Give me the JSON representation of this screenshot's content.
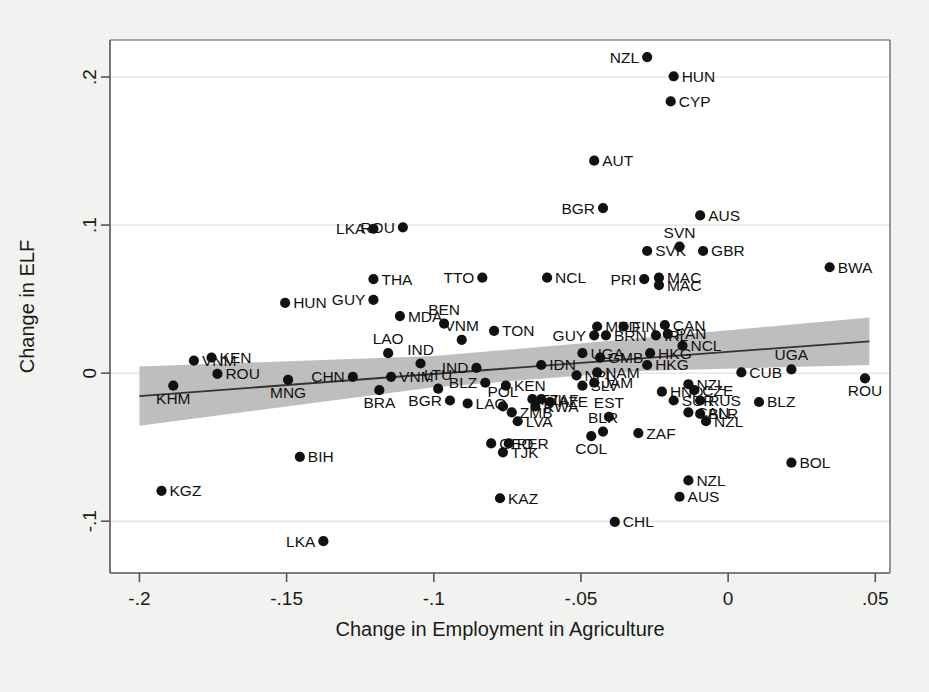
{
  "figure": {
    "background_color": "#f2f2f0",
    "plot_background_color": "#ffffff",
    "marker_color": "#111111",
    "fit_line_color": "#333333",
    "ci_band_color": "#b3b3b3"
  },
  "chart_data": {
    "type": "scatter",
    "title": "",
    "subtitle": "",
    "xlabel": "Change in Employment in Agriculture",
    "ylabel": "Change in ELF",
    "xlim": [
      -0.21,
      0.055
    ],
    "ylim": [
      -0.135,
      0.225
    ],
    "xticks": [
      -0.2,
      -0.15,
      -0.1,
      -0.05,
      0,
      0.05
    ],
    "xticklabels": [
      "-.2",
      "-.15",
      "-.1",
      "-.05",
      "0",
      ".05"
    ],
    "yticks": [
      -0.1,
      0,
      0.1,
      0.2
    ],
    "yticklabels": [
      "-.1",
      "0",
      ".1",
      ".2"
    ],
    "grid": true,
    "grid_axis": "y",
    "legend": null,
    "annotations": [],
    "fit_line": {
      "x": [
        -0.2,
        0.048
      ],
      "y": [
        -0.0155,
        0.0215
      ],
      "label": "linear fit"
    },
    "ci_band": {
      "x": [
        -0.2,
        -0.1,
        -0.03,
        0.048
      ],
      "upper": [
        0.0045,
        0.0115,
        0.0235,
        0.0375
      ],
      "lower": [
        -0.0355,
        -0.0095,
        0.0015,
        0.0055
      ],
      "label": "95% confidence interval"
    },
    "point_label_field": "iso3",
    "points": [
      {
        "iso3": "KGZ",
        "x": -0.1925,
        "y": -0.0795,
        "lp": "right"
      },
      {
        "iso3": "VNM",
        "x": -0.1815,
        "y": 0.0085,
        "lp": "right"
      },
      {
        "iso3": "KEN",
        "x": -0.1755,
        "y": 0.0105,
        "lp": "right"
      },
      {
        "iso3": "ROU",
        "x": -0.1735,
        "y": -0.0005,
        "lp": "right"
      },
      {
        "iso3": "KHM",
        "x": -0.1885,
        "y": -0.0085,
        "lp": "below"
      },
      {
        "iso3": "BIH",
        "x": -0.1455,
        "y": -0.0565,
        "lp": "right"
      },
      {
        "iso3": "LKA",
        "x": -0.1375,
        "y": -0.1135,
        "lp": "left"
      },
      {
        "iso3": "MNG",
        "x": -0.1495,
        "y": -0.0045,
        "lp": "below"
      },
      {
        "iso3": "HUN",
        "x": -0.1505,
        "y": 0.0475,
        "lp": "right"
      },
      {
        "iso3": "THA",
        "x": -0.1205,
        "y": 0.0635,
        "lp": "right"
      },
      {
        "iso3": "GUY",
        "x": -0.1205,
        "y": 0.0495,
        "lp": "left"
      },
      {
        "iso3": "MDA",
        "x": -0.1115,
        "y": 0.0385,
        "lp": "right"
      },
      {
        "iso3": "LAO",
        "x": -0.1155,
        "y": 0.0135,
        "lp": "above"
      },
      {
        "iso3": "CHN",
        "x": -0.1275,
        "y": -0.0025,
        "lp": "left"
      },
      {
        "iso3": "VNM",
        "x": -0.1145,
        "y": -0.0025,
        "lp": "right"
      },
      {
        "iso3": "BRA",
        "x": -0.1185,
        "y": -0.0115,
        "lp": "below"
      },
      {
        "iso3": "IND",
        "x": -0.1045,
        "y": 0.0065,
        "lp": "above"
      },
      {
        "iso3": "LTU",
        "x": -0.0985,
        "y": -0.0105,
        "lp": "above"
      },
      {
        "iso3": "BGR",
        "x": -0.0945,
        "y": -0.0185,
        "lp": "left"
      },
      {
        "iso3": "LAO",
        "x": -0.0885,
        "y": -0.0205,
        "lp": "right"
      },
      {
        "iso3": "ROU",
        "x": -0.1105,
        "y": 0.0985,
        "lp": "left"
      },
      {
        "iso3": "LKA",
        "x": -0.1205,
        "y": 0.0975,
        "lp": "left"
      },
      {
        "iso3": "BEN",
        "x": -0.0965,
        "y": 0.0335,
        "lp": "above"
      },
      {
        "iso3": "VNM",
        "x": -0.0905,
        "y": 0.0225,
        "lp": "above"
      },
      {
        "iso3": "IND",
        "x": -0.0855,
        "y": 0.0035,
        "lp": "left"
      },
      {
        "iso3": "BLZ",
        "x": -0.0825,
        "y": -0.0065,
        "lp": "left"
      },
      {
        "iso3": "TON",
        "x": -0.0795,
        "y": 0.0285,
        "lp": "right"
      },
      {
        "iso3": "TTO",
        "x": -0.0835,
        "y": 0.0645,
        "lp": "left"
      },
      {
        "iso3": "KEN",
        "x": -0.0755,
        "y": -0.0085,
        "lp": "right"
      },
      {
        "iso3": "POL",
        "x": -0.0765,
        "y": -0.0225,
        "lp": "above"
      },
      {
        "iso3": "ZMB",
        "x": -0.0735,
        "y": -0.0265,
        "lp": "right"
      },
      {
        "iso3": "LVA",
        "x": -0.0715,
        "y": -0.0325,
        "lp": "right"
      },
      {
        "iso3": "GEO",
        "x": -0.0805,
        "y": -0.0475,
        "lp": "right"
      },
      {
        "iso3": "PER",
        "x": -0.0745,
        "y": -0.0475,
        "lp": "right"
      },
      {
        "iso3": "TJK",
        "x": -0.0765,
        "y": -0.0535,
        "lp": "right"
      },
      {
        "iso3": "KAZ",
        "x": -0.0775,
        "y": -0.0845,
        "lp": "right"
      },
      {
        "iso3": "NCL",
        "x": -0.0615,
        "y": 0.0645,
        "lp": "right"
      },
      {
        "iso3": "IDN",
        "x": -0.0635,
        "y": 0.0055,
        "lp": "right"
      },
      {
        "iso3": "FJI",
        "x": -0.0665,
        "y": -0.0175,
        "lp": "right"
      },
      {
        "iso3": "ZAF",
        "x": -0.0635,
        "y": -0.0175,
        "lp": "right"
      },
      {
        "iso3": "RWA",
        "x": -0.0655,
        "y": -0.0225,
        "lp": "right"
      },
      {
        "iso3": "AZE",
        "x": -0.0605,
        "y": -0.0195,
        "lp": "right"
      },
      {
        "iso3": "GUY",
        "x": -0.0455,
        "y": 0.0255,
        "lp": "left"
      },
      {
        "iso3": "BRN",
        "x": -0.0415,
        "y": 0.0255,
        "lp": "right"
      },
      {
        "iso3": "MKD",
        "x": -0.0445,
        "y": 0.0315,
        "lp": "right"
      },
      {
        "iso3": "FIN",
        "x": -0.0355,
        "y": 0.0315,
        "lp": "right"
      },
      {
        "iso3": "BGR",
        "x": -0.0425,
        "y": 0.1115,
        "lp": "left"
      },
      {
        "iso3": "AUT",
        "x": -0.0455,
        "y": 0.1435,
        "lp": "right"
      },
      {
        "iso3": "NZL",
        "x": -0.0275,
        "y": 0.2135,
        "lp": "left"
      },
      {
        "iso3": "HUN",
        "x": -0.0185,
        "y": 0.2005,
        "lp": "right"
      },
      {
        "iso3": "CYP",
        "x": -0.0195,
        "y": 0.1835,
        "lp": "right"
      },
      {
        "iso3": "SVK",
        "x": -0.0275,
        "y": 0.0825,
        "lp": "right"
      },
      {
        "iso3": "SVN",
        "x": -0.0165,
        "y": 0.0855,
        "lp": "above"
      },
      {
        "iso3": "GBR",
        "x": -0.0085,
        "y": 0.0825,
        "lp": "right"
      },
      {
        "iso3": "AUS",
        "x": -0.0095,
        "y": 0.1065,
        "lp": "right"
      },
      {
        "iso3": "PRI",
        "x": -0.0285,
        "y": 0.0635,
        "lp": "left"
      },
      {
        "iso3": "MAC",
        "x": -0.0235,
        "y": 0.0645,
        "lp": "right"
      },
      {
        "iso3": "MAC",
        "x": -0.0235,
        "y": 0.0595,
        "lp": "right"
      },
      {
        "iso3": "CAN",
        "x": -0.0215,
        "y": 0.0325,
        "lp": "right"
      },
      {
        "iso3": "PAN",
        "x": -0.0205,
        "y": 0.0265,
        "lp": "right"
      },
      {
        "iso3": "IRL",
        "x": -0.0245,
        "y": 0.0255,
        "lp": "right"
      },
      {
        "iso3": "NCL",
        "x": -0.0155,
        "y": 0.0185,
        "lp": "right"
      },
      {
        "iso3": "HKG",
        "x": -0.0265,
        "y": 0.0135,
        "lp": "right"
      },
      {
        "iso3": "HKG",
        "x": -0.0275,
        "y": 0.0055,
        "lp": "right"
      },
      {
        "iso3": "GMB",
        "x": -0.0435,
        "y": 0.0105,
        "lp": "right"
      },
      {
        "iso3": "UGA",
        "x": -0.0495,
        "y": 0.0135,
        "lp": "right"
      },
      {
        "iso3": "NAM",
        "x": -0.0445,
        "y": 0.0005,
        "lp": "right"
      },
      {
        "iso3": "NPL",
        "x": -0.0515,
        "y": -0.0015,
        "lp": "right"
      },
      {
        "iso3": "JAM",
        "x": -0.0455,
        "y": -0.0065,
        "lp": "right"
      },
      {
        "iso3": "SLV",
        "x": -0.0495,
        "y": -0.0085,
        "lp": "right"
      },
      {
        "iso3": "HND",
        "x": -0.0225,
        "y": -0.0125,
        "lp": "right"
      },
      {
        "iso3": "NZL",
        "x": -0.0135,
        "y": -0.0075,
        "lp": "right"
      },
      {
        "iso3": "CZE",
        "x": -0.0115,
        "y": -0.0115,
        "lp": "right"
      },
      {
        "iso3": "CUB",
        "x": 0.0045,
        "y": 0.0005,
        "lp": "right"
      },
      {
        "iso3": "RUS",
        "x": -0.0095,
        "y": -0.0185,
        "lp": "right"
      },
      {
        "iso3": "SUR",
        "x": -0.0185,
        "y": -0.0185,
        "lp": "right"
      },
      {
        "iso3": "CAN",
        "x": -0.0135,
        "y": -0.0265,
        "lp": "right"
      },
      {
        "iso3": "BLR",
        "x": -0.0095,
        "y": -0.0275,
        "lp": "right"
      },
      {
        "iso3": "NZL",
        "x": -0.0075,
        "y": -0.0325,
        "lp": "right"
      },
      {
        "iso3": "EST",
        "x": -0.0405,
        "y": -0.0295,
        "lp": "above"
      },
      {
        "iso3": "BLR",
        "x": -0.0425,
        "y": -0.0395,
        "lp": "above"
      },
      {
        "iso3": "COL",
        "x": -0.0465,
        "y": -0.0425,
        "lp": "below"
      },
      {
        "iso3": "ZAF",
        "x": -0.0305,
        "y": -0.0405,
        "lp": "right"
      },
      {
        "iso3": "CHL",
        "x": -0.0385,
        "y": -0.1005,
        "lp": "right"
      },
      {
        "iso3": "NZL",
        "x": -0.0135,
        "y": -0.0725,
        "lp": "right"
      },
      {
        "iso3": "AUS",
        "x": -0.0165,
        "y": -0.0835,
        "lp": "right"
      },
      {
        "iso3": "BLZ",
        "x": 0.0105,
        "y": -0.0195,
        "lp": "right"
      },
      {
        "iso3": "UGA",
        "x": 0.0215,
        "y": 0.0025,
        "lp": "above"
      },
      {
        "iso3": "ROU",
        "x": 0.0465,
        "y": -0.0035,
        "lp": "below"
      },
      {
        "iso3": "BOL",
        "x": 0.0215,
        "y": -0.0605,
        "lp": "right"
      },
      {
        "iso3": "BWA",
        "x": 0.0345,
        "y": 0.0715,
        "lp": "right"
      }
    ]
  }
}
